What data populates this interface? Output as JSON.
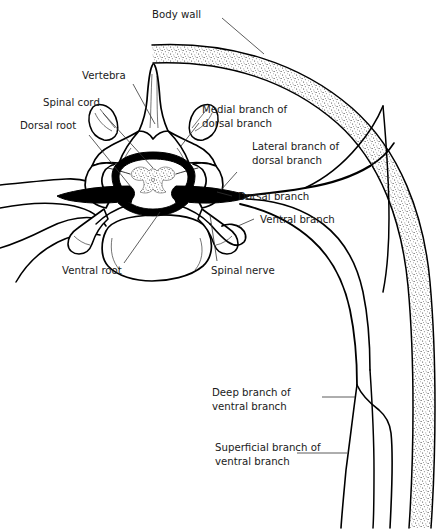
{
  "figure": {
    "background_color": "#ffffff",
    "ink_color": "#000000",
    "width": 447,
    "height": 532
  },
  "labels": {
    "body_wall": "Body wall",
    "vertebra": "Vertebra",
    "spinal_cord": "Spinal cord",
    "dorsal_root": "Dorsal root",
    "medial_branch_l1": "Medial branch of",
    "medial_branch_l2": "dorsal branch",
    "lateral_branch_l1": "Lateral branch of",
    "lateral_branch_l2": "dorsal branch",
    "dorsal_branch": "Dorsal branch",
    "ventral_branch": "Ventral branch",
    "ventral_root": "Ventral root",
    "spinal_nerve": "Spinal nerve",
    "deep_branch_l1": "Deep branch of",
    "deep_branch_l2": "ventral branch",
    "superficial_branch_l1": "Superficial branch of",
    "superficial_branch_l2": "ventral branch"
  },
  "structures": [
    {
      "name": "body-wall",
      "description": "stippled curved band at upper right representing the body wall in section"
    },
    {
      "name": "vertebra",
      "description": "transverse section of a vertebra with spinous process, transverse processes, laminae and body"
    },
    {
      "name": "spinal-cord",
      "description": "spinal cord in the vertebral canal with butterfly-shaped gray matter"
    },
    {
      "name": "dorsal-root",
      "description": "dorsal (posterior) root entering the spinal cord"
    },
    {
      "name": "ventral-root",
      "description": "ventral (anterior) root leaving the spinal cord"
    },
    {
      "name": "spinal-nerve",
      "description": "spinal nerve formed by the union of dorsal and ventral roots"
    },
    {
      "name": "dorsal-branch",
      "description": "dorsal (posterior) ramus of the spinal nerve"
    },
    {
      "name": "medial-branch-of-dorsal-branch",
      "description": "medial branch of the dorsal ramus"
    },
    {
      "name": "lateral-branch-of-dorsal-branch",
      "description": "lateral branch of the dorsal ramus"
    },
    {
      "name": "ventral-branch",
      "description": "ventral (anterior) ramus of the spinal nerve running in the body wall"
    },
    {
      "name": "deep-branch-of-ventral-branch",
      "description": "deep branch of the ventral ramus"
    },
    {
      "name": "superficial-branch-of-ventral-branch",
      "description": "superficial branch of the ventral ramus"
    }
  ]
}
